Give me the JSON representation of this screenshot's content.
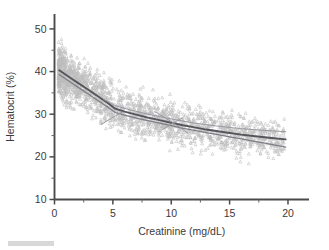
{
  "chart_data": {
    "type": "scatter",
    "title": "",
    "subtitle": "",
    "xlabel": "Creatinine (mg/dL)",
    "ylabel": "Hematocrit (%)",
    "xlim": [
      0,
      21.8
    ],
    "ylim": [
      10,
      53.5
    ],
    "xticks": [
      0,
      5,
      10,
      15,
      20
    ],
    "xticklabels": [
      "0",
      "5",
      "10",
      "15",
      "20"
    ],
    "xminorticks": [
      2.5,
      7.5,
      12.5,
      17.5
    ],
    "yticks": [
      10,
      20,
      30,
      40,
      50
    ],
    "yticklabels": [
      "10",
      "20",
      "30",
      "40",
      "50"
    ],
    "yminorticks": [
      15,
      25,
      35,
      45
    ],
    "grid": false,
    "legend": null,
    "marker": "triangle",
    "marker_color": "#bdbdbd",
    "point_count": 2000,
    "annotations": [],
    "series": [
      {
        "name": "observations",
        "type": "scatter",
        "marker": "triangle",
        "color": "#bdbdbd",
        "x_range": [
          0.3,
          20.0
        ],
        "y_range": [
          13.5,
          50.3
        ],
        "density_note": "dense band declining from ~40 at x=0.5 to ~24 at x=20; vertical spread ~+/-8 units"
      },
      {
        "name": "lowess-smoother-primary",
        "type": "line",
        "color": "#55555c",
        "width": 1.9,
        "points": [
          [
            0.4,
            40.3
          ],
          [
            1.0,
            39.2
          ],
          [
            1.6,
            38.1
          ],
          [
            2.2,
            37.0
          ],
          [
            2.8,
            35.9
          ],
          [
            3.4,
            34.8
          ],
          [
            4.0,
            33.7
          ],
          [
            4.6,
            32.6
          ],
          [
            5.2,
            31.3
          ],
          [
            6.0,
            30.6
          ],
          [
            7.0,
            29.9
          ],
          [
            8.0,
            29.2
          ],
          [
            9.0,
            28.6
          ],
          [
            10.0,
            28.0
          ],
          [
            11.0,
            27.4
          ],
          [
            12.0,
            26.9
          ],
          [
            13.0,
            26.4
          ],
          [
            14.0,
            26.0
          ],
          [
            15.0,
            25.6
          ],
          [
            16.0,
            25.2
          ],
          [
            17.0,
            24.9
          ],
          [
            18.0,
            24.6
          ],
          [
            19.0,
            24.3
          ],
          [
            19.8,
            24.1
          ]
        ]
      },
      {
        "name": "lowess-smoother-secondary",
        "type": "line",
        "color": "#7d7d86",
        "width": 1.25,
        "points": [
          [
            0.4,
            39.3
          ],
          [
            1.0,
            38.2
          ],
          [
            1.6,
            37.1
          ],
          [
            2.2,
            36.0
          ],
          [
            2.8,
            34.9
          ],
          [
            3.4,
            33.8
          ],
          [
            4.0,
            32.7
          ],
          [
            4.6,
            31.6
          ],
          [
            5.2,
            30.4
          ],
          [
            6.0,
            29.8
          ],
          [
            7.0,
            29.1
          ],
          [
            8.0,
            28.5
          ],
          [
            9.0,
            27.9
          ],
          [
            10.0,
            27.3
          ],
          [
            11.0,
            26.7
          ],
          [
            12.0,
            26.2
          ],
          [
            13.0,
            25.7
          ],
          [
            14.0,
            25.2
          ],
          [
            15.0,
            24.7
          ],
          [
            16.0,
            24.2
          ],
          [
            17.0,
            23.7
          ],
          [
            18.0,
            23.2
          ],
          [
            19.0,
            22.7
          ],
          [
            19.8,
            22.3
          ]
        ]
      },
      {
        "name": "regression-fit-upper",
        "type": "line",
        "color": "#9a9aa2",
        "width": 1.0,
        "points": [
          [
            4.2,
            33.5
          ],
          [
            5.2,
            32.0
          ],
          [
            6.5,
            31.0
          ],
          [
            8.0,
            30.0
          ],
          [
            10.0,
            28.9
          ],
          [
            12.0,
            27.9
          ],
          [
            14.0,
            27.2
          ],
          [
            16.0,
            26.6
          ],
          [
            18.0,
            26.2
          ],
          [
            19.8,
            25.9
          ]
        ]
      },
      {
        "name": "regression-fit-crossing",
        "type": "line",
        "color": "#9a9aa2",
        "width": 1.0,
        "points": [
          [
            8.6,
            30.6
          ],
          [
            9.4,
            29.3
          ],
          [
            10.2,
            27.9
          ],
          [
            10.9,
            26.6
          ],
          [
            11.4,
            25.6
          ]
        ]
      },
      {
        "name": "regression-fit-crossing-b",
        "type": "line",
        "color": "#9a9aa2",
        "width": 1.0,
        "points": [
          [
            9.2,
            26.3
          ],
          [
            9.8,
            27.3
          ],
          [
            10.4,
            28.3
          ],
          [
            11.0,
            29.2
          ]
        ]
      },
      {
        "name": "regression-fit-lower-left",
        "type": "line",
        "color": "#9a9aa2",
        "width": 1.0,
        "points": [
          [
            4.0,
            27.6
          ],
          [
            4.6,
            28.6
          ],
          [
            5.2,
            29.6
          ],
          [
            5.8,
            30.5
          ]
        ]
      }
    ]
  },
  "axes": {
    "y_title": "Hematocrit (%)",
    "x_title": "Creatinine (mg/dL)",
    "y_labels": [
      "50",
      "40",
      "30",
      "20",
      "10"
    ],
    "x_labels": [
      "0",
      "5",
      "10",
      "15",
      "20"
    ]
  }
}
